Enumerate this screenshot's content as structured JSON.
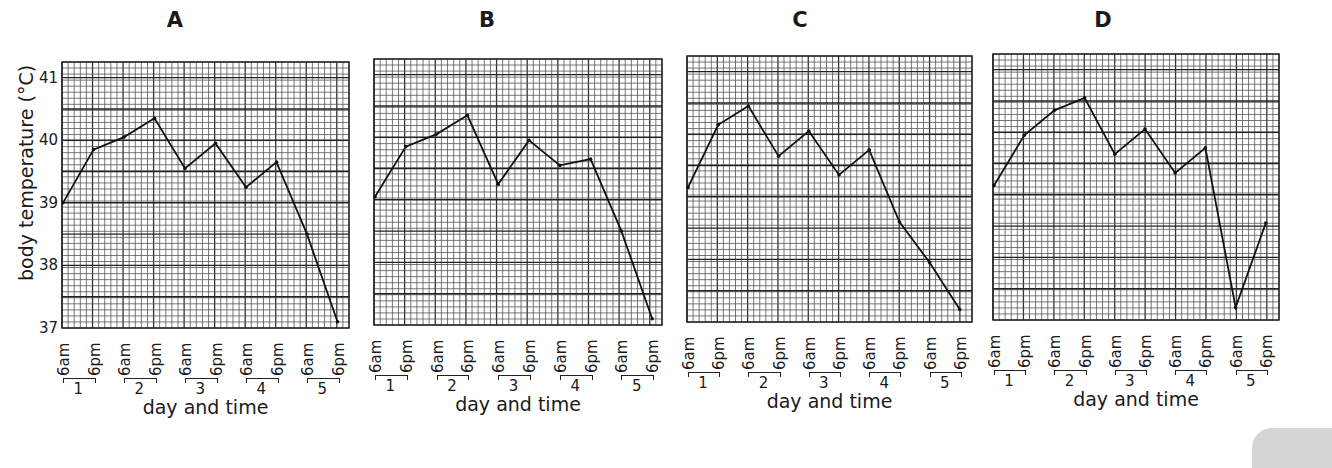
{
  "figure": {
    "ylabel": "body temperature (°C)",
    "xlabel": "day and time",
    "yticks": [
      "41",
      "40",
      "39",
      "38",
      "37"
    ],
    "time_ticks": [
      "6am",
      "6pm"
    ],
    "days": [
      "1",
      "2",
      "3",
      "4",
      "5"
    ]
  },
  "chart_data": [
    {
      "type": "line",
      "title": "A",
      "xlabel": "day and time",
      "ylabel": "body temperature (°C)",
      "ylim": [
        37,
        41.25
      ],
      "grid": true,
      "categories": [
        "1 6am",
        "1 6pm",
        "2 6am",
        "2 6pm",
        "3 6am",
        "3 6pm",
        "4 6am",
        "4 6pm",
        "5 6am",
        "5 6pm"
      ],
      "values": [
        39.0,
        39.85,
        40.05,
        40.35,
        39.55,
        39.95,
        39.25,
        39.65,
        38.5,
        37.1
      ]
    },
    {
      "type": "line",
      "title": "B",
      "xlabel": "day and time",
      "ylabel": "body temperature (°C)",
      "ylim": [
        37,
        41.25
      ],
      "grid": true,
      "categories": [
        "1 6am",
        "1 6pm",
        "2 6am",
        "2 6pm",
        "3 6am",
        "3 6pm",
        "4 6am",
        "4 6pm",
        "5 6am",
        "5 6pm"
      ],
      "values": [
        39.05,
        39.85,
        40.05,
        40.35,
        39.25,
        39.95,
        39.55,
        39.65,
        38.5,
        37.1
      ]
    },
    {
      "type": "line",
      "title": "C",
      "xlabel": "day and time",
      "ylabel": "body temperature (°C)",
      "ylim": [
        37,
        41.25
      ],
      "grid": true,
      "categories": [
        "1 6am",
        "1 6pm",
        "2 6am",
        "2 6pm",
        "3 6am",
        "3 6pm",
        "4 6am",
        "4 6pm",
        "5 6am",
        "5 6pm"
      ],
      "values": [
        39.15,
        40.15,
        40.45,
        39.65,
        40.05,
        39.35,
        39.75,
        38.6,
        37.95,
        37.2
      ]
    },
    {
      "type": "line",
      "title": "D",
      "xlabel": "day and time",
      "ylabel": "body temperature (°C)",
      "ylim": [
        37,
        41.25
      ],
      "grid": true,
      "categories": [
        "1 6am",
        "1 6pm",
        "2 6am",
        "2 6pm",
        "3 6am",
        "3 6pm",
        "4 6am",
        "4 6pm",
        "5 6am",
        "5 6pm"
      ],
      "values": [
        39.15,
        39.95,
        40.35,
        40.55,
        39.65,
        40.05,
        39.35,
        39.75,
        37.2,
        38.55
      ]
    }
  ],
  "layout": {
    "panels": [
      {
        "title_x": 175,
        "x0": 62,
        "y0": 62,
        "x1": 349,
        "y1": 328,
        "first_tick_x": 63,
        "tick_step": 30.5
      },
      {
        "title_x": 487,
        "x0": 374,
        "y0": 59,
        "x1": 662,
        "y1": 325,
        "first_tick_x": 375,
        "tick_step": 30.8
      },
      {
        "title_x": 800,
        "x0": 687,
        "y0": 56,
        "x1": 972,
        "y1": 322,
        "first_tick_x": 688,
        "tick_step": 30.2
      },
      {
        "title_x": 1103,
        "x0": 993,
        "y0": 54,
        "x1": 1279,
        "y1": 320,
        "first_tick_x": 994,
        "tick_step": 30.2
      }
    ]
  }
}
